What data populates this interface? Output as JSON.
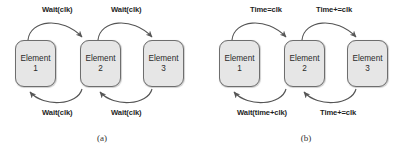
{
  "figure": {
    "panels": [
      {
        "id": "a",
        "caption": "(a)",
        "nodes": [
          {
            "name": "Element",
            "index": "1"
          },
          {
            "name": "Element",
            "index": "2"
          },
          {
            "name": "Element",
            "index": "3"
          }
        ],
        "edge_labels": {
          "top_left": "Wait(clk)",
          "top_right": "Wait(clk)",
          "bottom_left": "Wait(clk)",
          "bottom_right": "Wait(clk)"
        }
      },
      {
        "id": "b",
        "caption": "(b)",
        "nodes": [
          {
            "name": "Element",
            "index": "1"
          },
          {
            "name": "Element",
            "index": "2"
          },
          {
            "name": "Element",
            "index": "3"
          }
        ],
        "edge_labels": {
          "top_left": "Time=clk",
          "top_right": "Time+=clk",
          "bottom_left": "Wait(time+clk)",
          "bottom_right": "Time+=clk"
        }
      }
    ],
    "style": {
      "node_fill": "#e6e6e6",
      "node_border": "#6e6e6e",
      "arrow_color": "#555555",
      "text_color": "#1f1f1f",
      "background": "#ffffff"
    }
  }
}
